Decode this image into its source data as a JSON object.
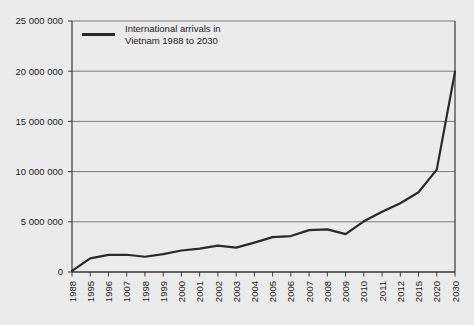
{
  "chart_data": {
    "type": "line",
    "title": "",
    "xlabel": "",
    "ylabel": "",
    "grid": true,
    "legend_position": "top-left-inside",
    "ylim": [
      0,
      25000000
    ],
    "ytick_values": [
      0,
      5000000,
      10000000,
      15000000,
      20000000,
      25000000
    ],
    "ytick_labels": [
      "0",
      "5 000 000",
      "10 000 000",
      "15 000 000",
      "20 000 000",
      "25 000 000"
    ],
    "categories": [
      "1988",
      "1995",
      "1996",
      "1007",
      "1998",
      "1999",
      "2000",
      "2001",
      "2002",
      "2003",
      "2004",
      "2005",
      "2006",
      "2007",
      "2008",
      "2009",
      "2010",
      "2011",
      "2012",
      "2015",
      "2020",
      "2030"
    ],
    "series": [
      {
        "name": "International arrivals in Vietnam 1988 to 2030",
        "color": "#2a2a2a",
        "values": [
          110000,
          1350000,
          1700000,
          1720000,
          1520000,
          1780000,
          2140000,
          2330000,
          2630000,
          2430000,
          2930000,
          3470000,
          3580000,
          4170000,
          4250000,
          3770000,
          5050000,
          6010000,
          6850000,
          7940000,
          10200000,
          19950000
        ]
      }
    ],
    "legend": [
      {
        "line1": "International arrivals in",
        "line2": "Vietnam 1988 to 2030",
        "swatch_color": "#2a2a2a"
      }
    ]
  },
  "page": {
    "background_color": "#ebebeb",
    "axis_color": "#3a3a3a",
    "gridline_color": "#6e6e6e"
  }
}
